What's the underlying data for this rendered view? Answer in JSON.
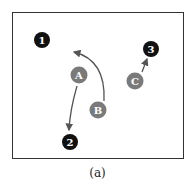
{
  "caption": "(a)",
  "colors": {
    "frame": "#333333",
    "numbered_node": "#111111",
    "lettered_node": "#7a7a7a",
    "arrow": "#555555"
  },
  "nodes": [
    {
      "id": "1",
      "label": "1",
      "type": "numbered",
      "x": 42,
      "y": 40
    },
    {
      "id": "2",
      "label": "2",
      "type": "numbered",
      "x": 70,
      "y": 142
    },
    {
      "id": "3",
      "label": "3",
      "type": "numbered",
      "x": 151,
      "y": 49
    },
    {
      "id": "A",
      "label": "A",
      "type": "lettered",
      "x": 79,
      "y": 75
    },
    {
      "id": "B",
      "label": "B",
      "type": "lettered",
      "x": 98,
      "y": 110
    },
    {
      "id": "C",
      "label": "C",
      "type": "lettered",
      "x": 135,
      "y": 81
    }
  ],
  "arrows": [
    {
      "from": "A",
      "to": "2"
    },
    {
      "from": "B",
      "to": "curve-end-near-top",
      "curved": true
    },
    {
      "from": "C",
      "to": "3"
    }
  ]
}
